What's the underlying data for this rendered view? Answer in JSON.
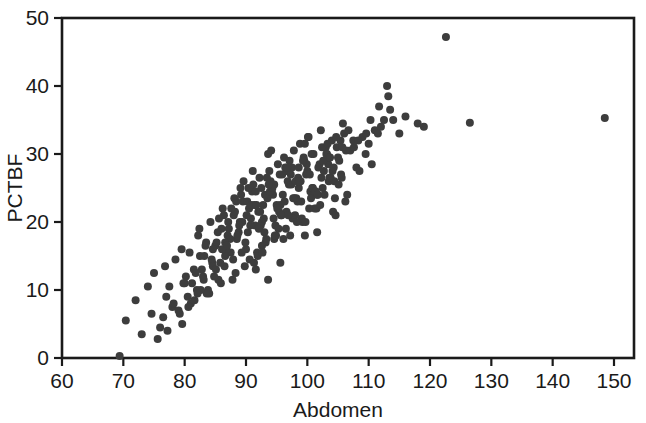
{
  "chart_data": {
    "type": "scatter",
    "title": "",
    "subtitle": "",
    "xlabel": "Abdomen",
    "ylabel": "PCTBF",
    "xlim": [
      60,
      150
    ],
    "ylim": [
      0,
      50
    ],
    "xticks": [
      60,
      70,
      80,
      90,
      100,
      110,
      120,
      130,
      140,
      150
    ],
    "yticks": [
      0,
      10,
      20,
      30,
      40,
      50
    ],
    "xtick_labels": [
      "60",
      "70",
      "80",
      "90",
      "100",
      "110",
      "120",
      "130",
      "140",
      "150"
    ],
    "ytick_labels": [
      "0",
      "10",
      "20",
      "30",
      "40",
      "50"
    ],
    "grid": false,
    "legend": null,
    "legend_position": "none",
    "marker": {
      "shape": "circle",
      "color": "#3d3d3d",
      "size_px": 8
    },
    "frame": {
      "top": true,
      "right": true,
      "bottom": true,
      "left": true,
      "color": "#1a1a1a"
    },
    "n_points": 252,
    "series": [
      {
        "name": "observations",
        "x": [
          69.4,
          75.6,
          74.6,
          76.0,
          77.0,
          78.0,
          79.6,
          80.0,
          81.0,
          81.5,
          82.0,
          82.5,
          83.0,
          83.5,
          84.0,
          84.5,
          85.0,
          85.5,
          86.0,
          86.5,
          87.0,
          87.5,
          88.0,
          88.5,
          89.0,
          89.5,
          90.0,
          90.5,
          91.0,
          91.5,
          92.0,
          92.5,
          93.0,
          93.5,
          94.0,
          94.5,
          95.0,
          95.5,
          96.0,
          96.5,
          97.0,
          97.5,
          98.0,
          98.5,
          99.0,
          99.5,
          100.0,
          100.5,
          101.0,
          101.5,
          102.0,
          102.5,
          103.0,
          103.5,
          104.0,
          104.5,
          105.0,
          105.5,
          106.0,
          106.5,
          107.0,
          108.0,
          109.0,
          110.0,
          111.0,
          112.0,
          113.0,
          113.5,
          114.0,
          115.0,
          122.6,
          126.5,
          148.5,
          70.4,
          72.0,
          73.0,
          75.0,
          76.5,
          77.5,
          78.5,
          79.0,
          79.5,
          80.5,
          81.2,
          82.2,
          82.8,
          83.2,
          83.8,
          84.2,
          84.8,
          85.2,
          85.8,
          86.2,
          86.8,
          87.2,
          87.8,
          88.2,
          88.8,
          89.2,
          89.8,
          90.2,
          90.8,
          91.2,
          91.8,
          92.2,
          92.8,
          93.2,
          93.8,
          94.2,
          94.8,
          95.2,
          95.8,
          96.2,
          96.8,
          97.2,
          97.8,
          98.2,
          98.8,
          99.2,
          99.8,
          100.2,
          100.8,
          101.2,
          101.8,
          102.2,
          102.8,
          103.2,
          103.8,
          104.2,
          104.8,
          105.2,
          105.8,
          106.2,
          107.5,
          108.5,
          109.5,
          110.5,
          111.5,
          112.5,
          113.2,
          116.0,
          118.0,
          119.0,
          74.0,
          76.8,
          78.2,
          79.8,
          80.8,
          81.8,
          82.4,
          83.4,
          84.4,
          85.4,
          86.4,
          87.4,
          88.4,
          89.4,
          90.4,
          91.4,
          92.4,
          93.4,
          94.4,
          95.4,
          96.4,
          97.4,
          98.4,
          99.4,
          100.4,
          101.4,
          102.4,
          103.4,
          104.4,
          105.4,
          85.6,
          86.6,
          87.6,
          88.6,
          89.6,
          90.6,
          91.6,
          92.6,
          93.6,
          94.6,
          95.6,
          96.6,
          97.6,
          98.6,
          99.6,
          100.6,
          101.6,
          102.6,
          103.6,
          104.6,
          83.6,
          84.6,
          88.1,
          89.1,
          90.1,
          91.1,
          92.1,
          93.1,
          94.1,
          95.1,
          96.1,
          97.1,
          98.1,
          99.1,
          100.1,
          101.1,
          102.1,
          103.1,
          104.1,
          105.1,
          79.2,
          80.2,
          81.6,
          82.6,
          84.6,
          86.6,
          87.1,
          91.6,
          92.6,
          93.6,
          94.6,
          95.6,
          96.6,
          98.6,
          99.6,
          101.6,
          103.6,
          105.6,
          107.6,
          109.6,
          77.2,
          80.6,
          82.1,
          83.1,
          85.1,
          86.1,
          87.9,
          88.9,
          89.9,
          90.9,
          91.9,
          92.9,
          93.9,
          94.9,
          95.9,
          96.9,
          97.9,
          98.9,
          99.9,
          100.9,
          88.3,
          89.3,
          90.3,
          91.3,
          92.3,
          93.3,
          94.3,
          95.3,
          96.3,
          97.3,
          98.3,
          99.3,
          100.3,
          101.3,
          102.3,
          103.3,
          104.3,
          106.3,
          108.3,
          110.3,
          85.9,
          86.9,
          90.7,
          91.7,
          92.7,
          93.7,
          94.7,
          95.7,
          96.7,
          97.7,
          98.7,
          99.7,
          100.7,
          101.7,
          102.7,
          103.7,
          104.7,
          105.7,
          106.7,
          111.7
        ],
        "y": [
          0.3,
          2.8,
          6.5,
          4.5,
          9.0,
          7.5,
          5.0,
          11.0,
          8.0,
          13.0,
          10.0,
          15.0,
          12.0,
          17.0,
          9.5,
          14.0,
          16.5,
          11.5,
          19.0,
          13.5,
          18.0,
          15.5,
          21.0,
          17.5,
          20.0,
          23.0,
          16.0,
          22.0,
          24.5,
          19.5,
          21.5,
          25.0,
          18.5,
          23.5,
          26.0,
          20.5,
          22.5,
          27.0,
          24.0,
          19.0,
          25.5,
          28.0,
          21.0,
          26.5,
          23.0,
          29.0,
          27.5,
          24.5,
          30.0,
          22.0,
          28.5,
          25.0,
          31.0,
          26.0,
          32.0,
          23.5,
          29.5,
          27.0,
          33.0,
          24.0,
          30.5,
          28.0,
          32.5,
          31.5,
          33.5,
          34.0,
          40.0,
          36.5,
          35.0,
          33.0,
          47.2,
          34.6,
          35.3,
          5.5,
          8.5,
          3.5,
          12.5,
          6.0,
          10.5,
          14.5,
          7.0,
          16.0,
          9.0,
          11.0,
          18.0,
          13.0,
          15.0,
          10.0,
          20.0,
          12.0,
          17.0,
          14.0,
          22.0,
          16.0,
          19.0,
          11.5,
          21.5,
          18.5,
          24.0,
          13.5,
          23.0,
          20.5,
          25.5,
          15.5,
          26.5,
          22.5,
          17.0,
          27.5,
          24.5,
          19.5,
          28.5,
          21.0,
          29.5,
          26.0,
          18.0,
          30.5,
          23.5,
          31.5,
          20.0,
          27.0,
          32.5,
          25.0,
          22.0,
          28.0,
          33.5,
          24.0,
          30.0,
          26.5,
          21.5,
          31.0,
          29.0,
          34.5,
          23.0,
          32.0,
          27.5,
          30.0,
          28.5,
          33.0,
          35.0,
          38.5,
          35.5,
          34.5,
          34.0,
          10.5,
          13.5,
          8.0,
          11.0,
          15.5,
          12.5,
          19.0,
          16.5,
          14.5,
          18.5,
          21.0,
          17.5,
          23.0,
          20.0,
          25.0,
          22.5,
          19.5,
          26.5,
          24.0,
          21.5,
          28.0,
          25.5,
          23.0,
          29.5,
          27.0,
          24.5,
          31.0,
          28.5,
          26.0,
          32.0,
          20.5,
          15.0,
          22.0,
          18.0,
          26.0,
          14.5,
          24.5,
          20.0,
          30.0,
          17.5,
          22.5,
          27.5,
          20.5,
          25.0,
          31.5,
          23.5,
          18.5,
          29.0,
          26.5,
          21.0,
          9.5,
          16.0,
          23.5,
          25.0,
          21.0,
          27.5,
          19.0,
          24.0,
          30.5,
          22.0,
          17.5,
          29.0,
          26.0,
          20.5,
          32.5,
          24.5,
          22.5,
          30.0,
          27.5,
          25.5,
          6.5,
          12.0,
          8.5,
          10.0,
          13.5,
          17.0,
          20.0,
          13.0,
          16.5,
          11.5,
          25.5,
          14.0,
          21.5,
          28.0,
          18.0,
          24.0,
          29.5,
          26.5,
          31.0,
          33.0,
          4.0,
          7.5,
          9.5,
          11.5,
          13.0,
          16.0,
          14.5,
          19.5,
          17.0,
          22.5,
          15.0,
          20.5,
          24.5,
          18.0,
          27.0,
          21.0,
          23.5,
          26.0,
          28.5,
          25.0,
          12.5,
          15.5,
          18.5,
          14.0,
          21.5,
          17.5,
          25.0,
          19.0,
          23.0,
          27.0,
          20.0,
          29.0,
          22.0,
          24.5,
          26.5,
          31.5,
          28.0,
          30.5,
          32.0,
          35.0,
          11.0,
          16.5,
          19.5,
          22.5,
          15.5,
          25.5,
          18.0,
          21.0,
          28.0,
          23.5,
          26.0,
          20.0,
          30.0,
          24.0,
          27.5,
          29.5,
          32.5,
          31.0,
          33.5,
          37.0
        ]
      }
    ]
  }
}
